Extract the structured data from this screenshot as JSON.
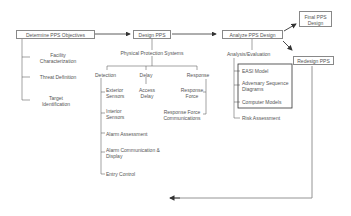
{
  "diagram": {
    "objectives": {
      "title": "Determine PPS Objectives",
      "items": [
        "Facility Characterization",
        "Threat Definition",
        "Target Identification"
      ]
    },
    "design": {
      "title": "Design PPS",
      "subtitle": "Physical Protection Systems",
      "detection": {
        "label": "Detection",
        "items": [
          "Exterior Sensors",
          "Interior Sensors",
          "Alarm Assessment",
          "Alarm Communication & Display",
          "Entry Control"
        ]
      },
      "delay": {
        "label": "Delay",
        "items": [
          "Access Delay"
        ]
      },
      "response": {
        "label": "Response",
        "items": [
          "Response Force",
          "Response Force Communications"
        ]
      }
    },
    "analyze": {
      "title": "Analyze PPS Design",
      "subtitle": "Analysis/Evaluation",
      "boxed_items": [
        "EASI Model",
        "Adversary Sequence Diagrams",
        "Computer Models"
      ],
      "items": [
        "Risk Assessment"
      ]
    },
    "final": {
      "title": "Final PPS Design"
    },
    "redesign": {
      "title": "Redesign PPS"
    }
  }
}
